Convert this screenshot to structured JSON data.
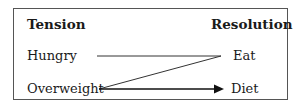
{
  "diagram": {
    "headers": {
      "left": "Tension",
      "right": "Resolution"
    },
    "tensions": [
      "Hungry",
      "Overweight"
    ],
    "resolutions": [
      "Eat",
      "Diet"
    ],
    "connections": [
      {
        "from": "Hungry",
        "to": "Eat",
        "style": "line"
      },
      {
        "from": "Overweight",
        "to": "Eat",
        "style": "line"
      },
      {
        "from": "Overweight",
        "to": "Diet",
        "style": "arrow"
      }
    ]
  }
}
